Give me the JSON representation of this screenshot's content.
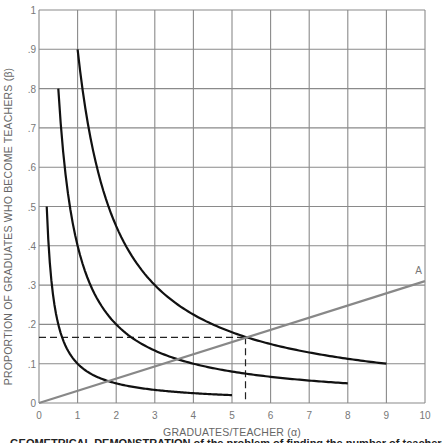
{
  "chart_data": {
    "type": "line",
    "title": "",
    "xlabel": "GRADUATES/TEACHER (α)",
    "ylabel": "PROPORTION OF GRADUATES WHO BECOME TEACHERS (β)",
    "xlim": [
      0,
      10
    ],
    "ylim": [
      0,
      1
    ],
    "grid": true,
    "x_ticks": [
      "0",
      "1",
      "2",
      "3",
      "4",
      "5",
      "6",
      "7",
      "8",
      "9",
      "10"
    ],
    "y_ticks": [
      "0",
      ".1",
      ".2",
      ".3",
      ".4",
      ".5",
      ".6",
      ".7",
      ".8",
      ".9",
      "1"
    ],
    "series": [
      {
        "name": "curve αβ=0.1",
        "color": "#111111",
        "x": [
          0.2,
          0.3,
          0.5,
          0.75,
          1,
          1.5,
          2,
          3,
          4,
          5
        ],
        "y": [
          0.5,
          0.333,
          0.2,
          0.133,
          0.1,
          0.067,
          0.05,
          0.033,
          0.025,
          0.02
        ]
      },
      {
        "name": "curve αβ=0.4",
        "color": "#111111",
        "x": [
          0.5,
          0.75,
          1,
          1.5,
          2,
          3,
          4,
          5,
          6,
          7,
          8
        ],
        "y": [
          0.8,
          0.533,
          0.4,
          0.267,
          0.2,
          0.133,
          0.1,
          0.08,
          0.067,
          0.057,
          0.05
        ]
      },
      {
        "name": "curve αβ=0.9",
        "color": "#111111",
        "x": [
          1,
          1.5,
          2,
          3,
          4,
          5,
          6,
          7,
          8,
          9
        ],
        "y": [
          0.9,
          0.6,
          0.45,
          0.3,
          0.225,
          0.18,
          0.15,
          0.129,
          0.1125,
          0.1
        ]
      },
      {
        "name": "A",
        "color": "#888888",
        "x": [
          0,
          10
        ],
        "y": [
          0,
          0.31
        ]
      }
    ],
    "annotations": [
      {
        "label": "A",
        "x": 9.8,
        "y": 0.32
      },
      {
        "type": "dashed-guide",
        "x": 5.35,
        "y": 0.167
      }
    ]
  },
  "labels": {
    "xlabel": "GRADUATES/TEACHER (α)",
    "ylabel": "PROPORTION OF GRADUATES WHO BECOME TEACHERS (β)",
    "line_a": "A",
    "caption_fragment": "GEOMETRICAL DEMONSTRATION of the problem of finding the number of teachers"
  }
}
